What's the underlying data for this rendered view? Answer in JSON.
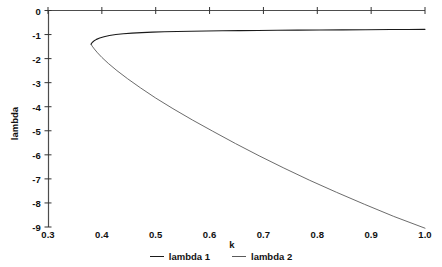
{
  "chart_data": {
    "type": "line",
    "title": "",
    "subtitle": "",
    "xlabel": "k",
    "ylabel": "lambda",
    "xlim": [
      0.3,
      1.0
    ],
    "ylim": [
      -9,
      0
    ],
    "grid": false,
    "legend_position": "bottom",
    "xticks": [
      "0.3",
      "0.4",
      "0.5",
      "0.6",
      "0.7",
      "0.8",
      "0.9",
      "1.0"
    ],
    "xtick_values": [
      0.3,
      0.4,
      0.5,
      0.6,
      0.7,
      0.8,
      0.9,
      1.0
    ],
    "yticks": [
      "0",
      "-1",
      "-2",
      "-3",
      "-4",
      "-5",
      "-6",
      "-7",
      "-8",
      "-9"
    ],
    "ytick_values": [
      0,
      -1,
      -2,
      -3,
      -4,
      -5,
      -6,
      -7,
      -8,
      -9
    ],
    "annotations": [],
    "series": [
      {
        "name": "lambda 1",
        "color": "#1a1a1a",
        "x": [
          0.38,
          0.382,
          0.385,
          0.39,
          0.396,
          0.404,
          0.414,
          0.426,
          0.44,
          0.456,
          0.474,
          0.494,
          0.516,
          0.54,
          0.566,
          0.594,
          0.624,
          0.656,
          0.69,
          0.726,
          0.764,
          0.804,
          0.846,
          0.89,
          0.936,
          0.968,
          1.0
        ],
        "values": [
          -1.4,
          -1.33,
          -1.27,
          -1.2,
          -1.145,
          -1.09,
          -1.04,
          -1.0,
          -0.968,
          -0.94,
          -0.918,
          -0.9,
          -0.885,
          -0.872,
          -0.862,
          -0.852,
          -0.844,
          -0.836,
          -0.829,
          -0.822,
          -0.816,
          -0.81,
          -0.804,
          -0.798,
          -0.792,
          -0.788,
          -0.783
        ]
      },
      {
        "name": "lambda 2",
        "color": "#5a5a5a",
        "x": [
          0.38,
          0.382,
          0.386,
          0.392,
          0.4,
          0.412,
          0.428,
          0.448,
          0.472,
          0.5,
          0.532,
          0.568,
          0.606,
          0.648,
          0.692,
          0.738,
          0.786,
          0.836,
          0.888,
          0.942,
          1.0
        ],
        "values": [
          -1.4,
          -1.48,
          -1.6,
          -1.76,
          -1.95,
          -2.2,
          -2.5,
          -2.84,
          -3.22,
          -3.64,
          -4.08,
          -4.55,
          -5.02,
          -5.53,
          -6.04,
          -6.55,
          -7.06,
          -7.56,
          -8.06,
          -8.56,
          -9.05
        ]
      }
    ]
  },
  "legend": {
    "entries": [
      {
        "label": "lambda 1"
      },
      {
        "label": "lambda 2"
      }
    ]
  },
  "axes": {
    "x_axis_label": "k",
    "y_axis_label": "lambda"
  }
}
